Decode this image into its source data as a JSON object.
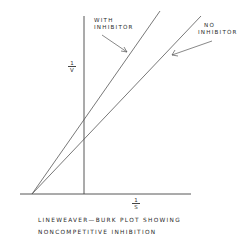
{
  "diagram": {
    "type": "lineweaver-burk-plot",
    "y_axis_label": {
      "numerator": "1",
      "denominator": "V"
    },
    "x_axis_label": {
      "numerator": "1",
      "denominator": "S"
    },
    "lines": [
      {
        "name": "with-inhibitor",
        "label_line1": "WITH",
        "label_line2": "INHIBITOR"
      },
      {
        "name": "no-inhibitor",
        "label_line1": "NO",
        "label_line2": "INHIBITOR"
      }
    ],
    "caption_line1": "LINEWEAVER—BURK  PLOT  SHOWING",
    "caption_line2": "NONCOMPETITIVE   INHIBITION",
    "colors": {
      "ink": "#3a3a3a",
      "background": "#ffffff"
    }
  }
}
